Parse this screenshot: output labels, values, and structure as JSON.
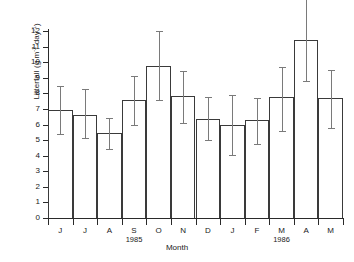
{
  "chart_data": {
    "type": "bar",
    "title": "",
    "xlabel": "Month",
    "ylabel": "Litterfall (g m⁻² day⁻¹)",
    "ylabel_parts": {
      "prefix": "Litterfall (g m",
      "sup1": "-2",
      "mid": " day",
      "sup2": "-1",
      "suffix": ")"
    },
    "categories": [
      "J",
      "J",
      "A",
      "S",
      "O",
      "N",
      "D",
      "J",
      "F",
      "M",
      "A",
      "M"
    ],
    "values": [
      6.95,
      6.62,
      5.45,
      7.55,
      9.75,
      7.82,
      6.35,
      5.95,
      6.3,
      7.75,
      11.4,
      7.72
    ],
    "error_high": [
      8.45,
      8.3,
      6.42,
      9.12,
      12.0,
      9.45,
      7.78,
      7.92,
      7.72,
      9.72,
      13.6,
      9.48
    ],
    "error_low": [
      5.42,
      5.15,
      4.42,
      5.95,
      7.55,
      6.12,
      4.98,
      4.05,
      4.78,
      5.6,
      8.8,
      5.78
    ],
    "error_high_clipped": [
      false,
      false,
      false,
      false,
      false,
      false,
      false,
      false,
      false,
      false,
      true,
      false
    ],
    "ylim": [
      0,
      12
    ],
    "yticks": [
      0,
      1,
      2,
      3,
      4,
      5,
      6,
      7,
      8,
      9,
      10,
      11,
      12
    ],
    "ytick_labels": [
      "0",
      "1",
      "2",
      "3",
      "4",
      "5",
      "6",
      "7",
      "8",
      "9",
      "10",
      "11",
      "12"
    ],
    "grid": false,
    "legend": null,
    "group_labels": [
      {
        "text": "1985",
        "category_index": 3
      },
      {
        "text": "1986",
        "category_index": 9
      }
    ],
    "bar_style": {
      "fill": "none",
      "edge": "#3a3a3a"
    },
    "error_style": {
      "color": "#7a7a7a",
      "cap": true
    }
  }
}
